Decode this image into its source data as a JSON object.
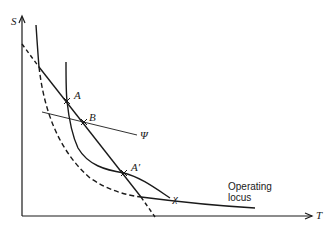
{
  "axes": {
    "y_label": "S",
    "x_label": "T"
  },
  "points": {
    "A": "A",
    "B": "B",
    "A_prime": "A′"
  },
  "curves": {
    "psi_label": "Ψ",
    "chi_label": "χ",
    "operating_locus_line1": "Operating",
    "operating_locus_line2": "locus"
  },
  "colors": {
    "ink": "#1a1a1a",
    "background": "#ffffff"
  }
}
